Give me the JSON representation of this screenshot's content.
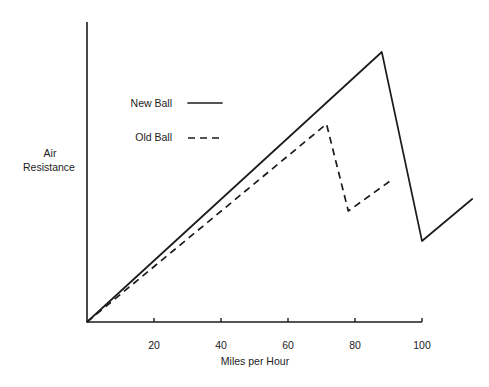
{
  "chart_data": {
    "type": "line",
    "title": "",
    "xlabel": "Miles per Hour",
    "ylabel_lines": [
      "Air",
      "Resistance"
    ],
    "xlim": [
      0,
      100
    ],
    "ylim": [
      0,
      100
    ],
    "x_ticks": [
      20,
      40,
      60,
      80,
      100
    ],
    "x_tick_labels": [
      "20",
      "40",
      "60",
      "80",
      "100"
    ],
    "y_ticks": [],
    "grid": false,
    "legend_position": "upper-left",
    "series": [
      {
        "name": "New Ball",
        "style": "solid",
        "color": "#1c1c1c",
        "x": [
          0,
          88,
          100,
          115
        ],
        "y": [
          0,
          90,
          27,
          41
        ]
      },
      {
        "name": "Old Ball",
        "style": "dashed",
        "color": "#1c1c1c",
        "x": [
          0,
          71.5,
          78,
          90.5
        ],
        "y": [
          0,
          66,
          37,
          47
        ]
      }
    ]
  }
}
